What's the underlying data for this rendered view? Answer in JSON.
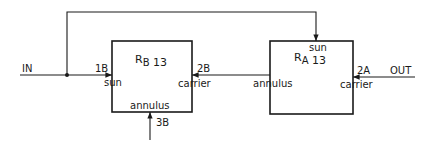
{
  "diagram": {
    "input_label": "IN",
    "output_label": "OUT",
    "colors": {
      "line": "#1a1a1a",
      "background": "#ffffff"
    },
    "blocks": [
      {
        "id": "RB",
        "name_main": "R",
        "name_sub": "B",
        "name_num": "13",
        "ports": {
          "left": {
            "id": "1B",
            "member": "sun"
          },
          "right": {
            "id": "2B",
            "member": "carrier"
          },
          "bottom": {
            "id": "3B",
            "member": "annulus"
          }
        }
      },
      {
        "id": "RA",
        "name_main": "R",
        "name_sub": "A",
        "name_num": "13",
        "ports": {
          "top": {
            "member": "sun"
          },
          "left": {
            "member": "annulus"
          },
          "right": {
            "id": "2A",
            "member": "carrier"
          }
        }
      }
    ],
    "connections": [
      {
        "from": "IN",
        "to": "RB.sun (1B)"
      },
      {
        "from": "IN junction",
        "to": "RA.sun (feedback over top)"
      },
      {
        "from": "RA.annulus",
        "to": "RB.carrier (2B)"
      },
      {
        "from": "OUT",
        "to": "RA.carrier (2A)"
      },
      {
        "from": "3B",
        "to": "RB.annulus"
      }
    ]
  }
}
